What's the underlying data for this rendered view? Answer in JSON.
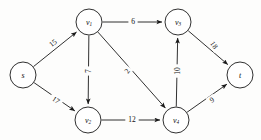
{
  "figure": {
    "background_color": "#fdfdfc",
    "stroke_color": "#1a1a1a",
    "width": 261,
    "height": 140
  },
  "graph": {
    "type": "directed-weighted-graph",
    "nodes": [
      {
        "id": "s",
        "label": "s",
        "sub": "",
        "cx": 23,
        "cy": 75,
        "r": 13
      },
      {
        "id": "v1",
        "label": "v",
        "sub": "1",
        "cx": 89,
        "cy": 22,
        "r": 13
      },
      {
        "id": "v2",
        "label": "v",
        "sub": "2",
        "cx": 88,
        "cy": 120,
        "r": 13
      },
      {
        "id": "v3",
        "label": "v",
        "sub": "3",
        "cx": 178,
        "cy": 22,
        "r": 13
      },
      {
        "id": "v4",
        "label": "v",
        "sub": "4",
        "cx": 176,
        "cy": 120,
        "r": 13
      },
      {
        "id": "t",
        "label": "t",
        "sub": "",
        "cx": 240,
        "cy": 75,
        "r": 13
      }
    ],
    "edges": [
      {
        "id": "s-v1",
        "from": "s",
        "to": "v1",
        "weight": "15",
        "lx": 53,
        "ly": 43,
        "rot": -38
      },
      {
        "id": "s-v2",
        "from": "s",
        "to": "v2",
        "weight": "17",
        "lx": 56,
        "ly": 100,
        "rot": 34
      },
      {
        "id": "v1-v3",
        "from": "v1",
        "to": "v3",
        "weight": "6",
        "lx": 133,
        "ly": 21,
        "rot": 0
      },
      {
        "id": "v1-v2",
        "from": "v1",
        "to": "v2",
        "weight": "7",
        "lx": 88,
        "ly": 71,
        "rot": -90
      },
      {
        "id": "v1-v4",
        "from": "v1",
        "to": "v4",
        "weight": "2",
        "lx": 127,
        "ly": 71,
        "rot": -54
      },
      {
        "id": "v2-v4",
        "from": "v2",
        "to": "v4",
        "weight": "12",
        "lx": 132,
        "ly": 119,
        "rot": 0
      },
      {
        "id": "v4-v3",
        "from": "v4",
        "to": "v3",
        "weight": "10",
        "lx": 177,
        "ly": 71,
        "rot": -90
      },
      {
        "id": "v3-t",
        "from": "v3",
        "to": "t",
        "weight": "18",
        "lx": 214,
        "ly": 45,
        "rot": 55
      },
      {
        "id": "v4-t",
        "from": "v4",
        "to": "t",
        "weight": "9",
        "lx": 212,
        "ly": 100,
        "rot": -34
      }
    ]
  }
}
